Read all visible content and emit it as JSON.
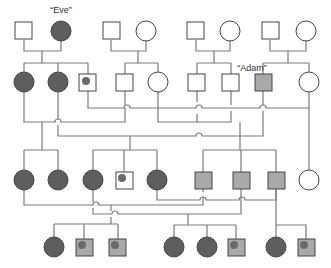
{
  "diagram": {
    "type": "pedigree-chart",
    "labels": {
      "eve": "“Eve”",
      "adam": "“Adam”"
    },
    "colors": {
      "line": "#777777",
      "outline": "#444444",
      "affected_female": "#5e5e5e",
      "affected_male": "#a9a9a9",
      "carrier_dot": "#6a6a6a",
      "unaffected": "#ffffff"
    },
    "legend_meaning": {
      "dark_circle": "affected female",
      "gray_square": "affected male",
      "dot": "carrier",
      "white": "unaffected"
    },
    "generations": [
      {
        "name": "generation-1",
        "individuals": [
          {
            "sex": "male",
            "status": "unaffected"
          },
          {
            "sex": "female",
            "status": "affected",
            "label": "Eve"
          },
          {
            "sex": "male",
            "status": "unaffected"
          },
          {
            "sex": "female",
            "status": "unaffected"
          },
          {
            "sex": "male",
            "status": "unaffected"
          },
          {
            "sex": "female",
            "status": "unaffected"
          },
          {
            "sex": "male",
            "status": "unaffected"
          },
          {
            "sex": "female",
            "status": "unaffected"
          }
        ]
      },
      {
        "name": "generation-2",
        "individuals": [
          {
            "sex": "female",
            "status": "affected"
          },
          {
            "sex": "female",
            "status": "affected"
          },
          {
            "sex": "male",
            "status": "carrier"
          },
          {
            "sex": "male",
            "status": "unaffected"
          },
          {
            "sex": "female",
            "status": "unaffected"
          },
          {
            "sex": "male",
            "status": "unaffected"
          },
          {
            "sex": "male",
            "status": "unaffected"
          },
          {
            "sex": "male",
            "status": "affected",
            "label": "Adam"
          },
          {
            "sex": "female",
            "status": "unaffected"
          }
        ]
      },
      {
        "name": "generation-3",
        "individuals": [
          {
            "sex": "female",
            "status": "affected"
          },
          {
            "sex": "female",
            "status": "affected"
          },
          {
            "sex": "female",
            "status": "affected"
          },
          {
            "sex": "male",
            "status": "carrier"
          },
          {
            "sex": "female",
            "status": "affected"
          },
          {
            "sex": "male",
            "status": "affected"
          },
          {
            "sex": "male",
            "status": "affected"
          },
          {
            "sex": "male",
            "status": "affected"
          },
          {
            "sex": "female",
            "status": "unaffected"
          }
        ]
      },
      {
        "name": "generation-4",
        "individuals": [
          {
            "sex": "female",
            "status": "affected"
          },
          {
            "sex": "male",
            "status": "affected-carrier"
          },
          {
            "sex": "male",
            "status": "affected-carrier"
          },
          {
            "sex": "female",
            "status": "affected"
          },
          {
            "sex": "female",
            "status": "affected"
          },
          {
            "sex": "male",
            "status": "affected-carrier"
          },
          {
            "sex": "female",
            "status": "affected"
          },
          {
            "sex": "male",
            "status": "affected-carrier"
          }
        ]
      }
    ]
  }
}
